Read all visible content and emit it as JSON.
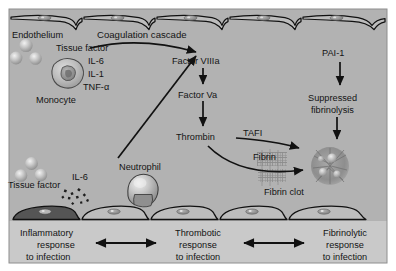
{
  "figure": {
    "title_note": "Interaction of inflammatory, thrombotic and fibrinolytic responses to infection",
    "colors": {
      "vessel_background": "#b2b2b2",
      "panel_background": "#c9c9c9",
      "endothelium_fill": "#bdbdbd",
      "endothelium_activated": "#555555",
      "outline": "#111111",
      "cell_fill": "#c2c2c2",
      "fibrin": "#9a9a9a",
      "clot": "#8f8f8f"
    }
  },
  "vessel": {
    "endothelium_label": "Endothelium",
    "cascade_label": "Coagulation cascade",
    "top_cell_count": 5,
    "bottom_cell_count": 5
  },
  "inflammatory": {
    "tissue_factor_top": "Tissue factor",
    "cytokines": [
      "IL-6",
      "IL-1",
      "TNF-α"
    ],
    "monocyte_label": "Monocyte",
    "tissue_factor_bottom": "Tissue factor",
    "il6_label": "IL-6",
    "neutrophil_label": "Neutrophil"
  },
  "coagulation": {
    "steps": [
      "Factor VIIIa",
      "Factor Va",
      "Thrombin"
    ],
    "fibrin_label": "Fibrin",
    "fibrin_clot_label": "Fibrin clot",
    "tafi_label": "TAFI"
  },
  "fibrinolysis": {
    "pai1_label": "PAI-1",
    "suppressed_line1": "Suppressed",
    "suppressed_line2": "fibrinolysis"
  },
  "bottom_panel": {
    "responses": [
      {
        "line1": "Inflammatory",
        "line2": "response",
        "line3": "to infection"
      },
      {
        "line1": "Thrombotic",
        "line2": "response",
        "line3": "to infection"
      },
      {
        "line1": "Fibrinolytic",
        "line2": "response",
        "line3": "to infection"
      }
    ],
    "connector_count": 2,
    "connector_type": "double-headed-arrow"
  }
}
